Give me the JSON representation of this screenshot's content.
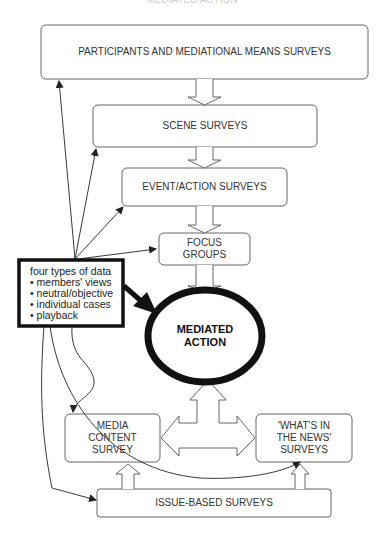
{
  "header": {
    "title": "MEDIATED ACTION"
  },
  "diagram": {
    "boxes": {
      "participants": "PARTICIPANTS AND MEDIATIONAL MEANS SURVEYS",
      "scene": "SCENE SURVEYS",
      "event": "EVENT/ACTION SURVEYS",
      "focus_line1": "FOCUS",
      "focus_line2": "GROUPS",
      "center_line1": "MEDIATED",
      "center_line2": "ACTION",
      "media_line1": "MEDIA",
      "media_line2": "CONTENT",
      "media_line3": "SURVEY",
      "news_line1": "'WHAT'S IN",
      "news_line2": "THE NEWS'",
      "news_line3": "SURVEYS",
      "issue": "ISSUE-BASED SURVEYS"
    },
    "data_types": {
      "title": "four types of data",
      "items": [
        "members' views",
        "neutral/objective",
        "individual cases",
        "playback"
      ]
    }
  }
}
